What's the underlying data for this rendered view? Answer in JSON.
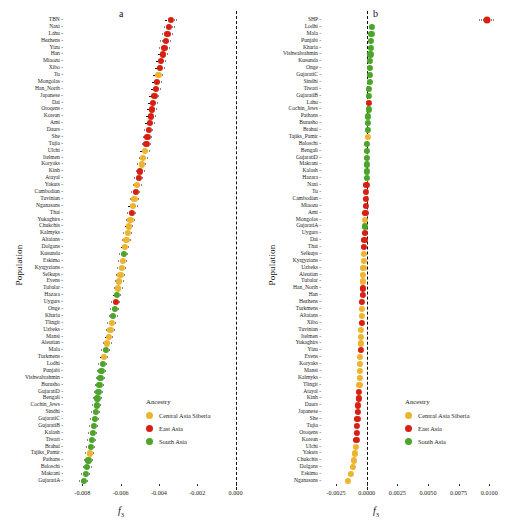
{
  "figure": {
    "ylabel": "Population",
    "panels": [
      "a",
      "b"
    ]
  },
  "legend": {
    "title": "Ancestry",
    "entries": [
      {
        "label": "Central Asia Siberia",
        "color": "#EDB430"
      },
      {
        "label": "East Asia",
        "color": "#D91F11"
      },
      {
        "label": "South Asia",
        "color": "#4CA52A"
      }
    ]
  },
  "chart_data": [
    {
      "type": "scatter",
      "panel": "a",
      "title": "a",
      "xlabel": "f3",
      "xlabel_sub": "3",
      "ylabel": "Population",
      "xlim": [
        -0.0088,
        0.0007
      ],
      "xticks": [
        -0.008,
        -0.006,
        -0.004,
        -0.002,
        0.0
      ],
      "xticklabels": [
        "-0.008",
        "-0.006",
        "-0.004",
        "-0.002",
        "0.000"
      ],
      "grid": false,
      "reference_line": 0.0,
      "legend_position": "lower-right",
      "categories": [
        "TBN",
        "Naxi",
        "Lahu",
        "Hezhens",
        "Yizu",
        "Han",
        "Miaozu",
        "Xibo",
        "Tu",
        "Mongolas",
        "Han_North",
        "Japanese",
        "Dai",
        "Oroqens",
        "Korean",
        "Ami",
        "Daurs",
        "She",
        "Tujia",
        "Ulchi",
        "Itelmen",
        "Koryaks",
        "Kinh",
        "Atayal",
        "Yakuts",
        "Cambodian",
        "Tuvinian",
        "Nganasans",
        "Thai",
        "Yukaghirs",
        "Chukchis",
        "Kalmyks",
        "Altaians",
        "Dolgans",
        "Kusunda",
        "Eskimo",
        "Kyrgyzians",
        "Selkups",
        "Evens",
        "Tubalar",
        "Hazara",
        "Uygurs",
        "Onge",
        "Kharia",
        "Tlingit",
        "Uzbeks",
        "Mansi",
        "Aleutian",
        "Mala",
        "Turkmens",
        "Lodhi",
        "Punjabi",
        "Vishwabrahmin",
        "Burusho",
        "GujaratiD",
        "Bengali",
        "Cochin_Jews",
        "Sindhi",
        "GujaratiC",
        "GujaratiB",
        "Kalash",
        "Tiwari",
        "Brahui",
        "Tajiks_Pamir",
        "Pathans",
        "Baloschi",
        "Makrani",
        "GujaratiA"
      ],
      "values": [
        -0.00338,
        -0.00346,
        -0.00356,
        -0.00364,
        -0.00372,
        -0.0038,
        -0.00388,
        -0.00396,
        -0.00403,
        -0.0041,
        -0.00417,
        -0.00424,
        -0.0043,
        -0.00436,
        -0.00442,
        -0.00448,
        -0.00454,
        -0.0046,
        -0.00466,
        -0.00474,
        -0.00482,
        -0.0049,
        -0.00498,
        -0.00506,
        -0.00514,
        -0.00521,
        -0.00528,
        -0.00535,
        -0.00542,
        -0.00549,
        -0.00556,
        -0.00563,
        -0.0057,
        -0.00577,
        -0.00583,
        -0.00589,
        -0.00595,
        -0.00601,
        -0.00607,
        -0.00613,
        -0.00619,
        -0.00625,
        -0.00632,
        -0.00639,
        -0.00646,
        -0.00653,
        -0.00661,
        -0.0067,
        -0.00679,
        -0.00687,
        -0.00694,
        -0.007,
        -0.00706,
        -0.00711,
        -0.00716,
        -0.00721,
        -0.00726,
        -0.00731,
        -0.00736,
        -0.00741,
        -0.00746,
        -0.00751,
        -0.00756,
        -0.00761,
        -0.00768,
        -0.00775,
        -0.00783,
        -0.00792
      ],
      "errors": [
        0.0003,
        0.00029,
        0.00029,
        0.00028,
        0.00028,
        0.00027,
        0.00027,
        0.00027,
        0.00026,
        0.00026,
        0.00026,
        0.00026,
        0.00025,
        0.00025,
        0.00025,
        0.00025,
        0.00025,
        0.00025,
        0.00025,
        0.00025,
        0.00024,
        0.00024,
        0.00024,
        0.00024,
        0.00024,
        0.00024,
        0.00024,
        0.00024,
        0.00024,
        0.00023,
        0.00023,
        0.00023,
        0.00023,
        0.00023,
        0.00023,
        0.00023,
        0.00023,
        0.00023,
        0.00023,
        0.00023,
        0.00023,
        0.00023,
        0.00023,
        0.00023,
        0.00023,
        0.00023,
        0.00023,
        0.00023,
        0.00023,
        0.00023,
        0.00023,
        0.00023,
        0.00023,
        0.00023,
        0.00023,
        0.00023,
        0.00023,
        0.00023,
        0.00023,
        0.00023,
        0.00023,
        0.00023,
        0.00023,
        0.00023,
        0.00023,
        0.00023,
        0.00023,
        0.00023
      ],
      "ancestry": [
        "East Asia",
        "East Asia",
        "East Asia",
        "East Asia",
        "East Asia",
        "East Asia",
        "East Asia",
        "East Asia",
        "Central Asia Siberia",
        "East Asia",
        "East Asia",
        "East Asia",
        "East Asia",
        "East Asia",
        "East Asia",
        "East Asia",
        "East Asia",
        "East Asia",
        "East Asia",
        "Central Asia Siberia",
        "Central Asia Siberia",
        "Central Asia Siberia",
        "East Asia",
        "East Asia",
        "Central Asia Siberia",
        "East Asia",
        "Central Asia Siberia",
        "Central Asia Siberia",
        "East Asia",
        "Central Asia Siberia",
        "Central Asia Siberia",
        "Central Asia Siberia",
        "Central Asia Siberia",
        "Central Asia Siberia",
        "South Asia",
        "Central Asia Siberia",
        "Central Asia Siberia",
        "Central Asia Siberia",
        "Central Asia Siberia",
        "Central Asia Siberia",
        "South Asia",
        "East Asia",
        "South Asia",
        "South Asia",
        "Central Asia Siberia",
        "Central Asia Siberia",
        "Central Asia Siberia",
        "Central Asia Siberia",
        "South Asia",
        "Central Asia Siberia",
        "South Asia",
        "South Asia",
        "South Asia",
        "South Asia",
        "South Asia",
        "South Asia",
        "South Asia",
        "South Asia",
        "South Asia",
        "South Asia",
        "South Asia",
        "South Asia",
        "South Asia",
        "Central Asia Siberia",
        "South Asia",
        "South Asia",
        "South Asia",
        "South Asia"
      ]
    },
    {
      "type": "scatter",
      "panel": "b",
      "title": "b",
      "xlabel": "f3",
      "xlabel_sub": "3",
      "ylabel": "Population",
      "xlim": [
        -0.0034,
        0.0112
      ],
      "xticks": [
        -0.0025,
        0.0,
        0.0025,
        0.005,
        0.0075,
        0.01
      ],
      "xticklabels": [
        "-0.0025",
        "0.0000",
        "0.0025",
        "0.0050",
        "0.0075",
        "0.0100"
      ],
      "grid": false,
      "reference_line": 0.0,
      "legend_position": "lower-right",
      "categories": [
        "SHP",
        "Lodhi",
        "Mala",
        "Punjabi",
        "Kharia",
        "Vishwabrahmin",
        "Kusunda",
        "Onge",
        "GujaratiC",
        "Sindhi",
        "Tiwari",
        "GujaratiB",
        "Lahu",
        "Cochin_Jews",
        "Pathans",
        "Burusho",
        "Brahui",
        "Tajiks_Pamir",
        "Baloschi",
        "Bengali",
        "GujaratiD",
        "Makrani",
        "Kalash",
        "Hazara",
        "Naxi",
        "Tu",
        "Cambodian",
        "Miaozu",
        "Ami",
        "Mongolas",
        "GujaratiA",
        "Uygurs",
        "Dai",
        "Thai",
        "Selkups",
        "Kyrgyzians",
        "Uzbeks",
        "Aleutian",
        "Tubalar",
        "Han_North",
        "Han",
        "Hezhens",
        "Turkmens",
        "Altaians",
        "Xibo",
        "Tuvinian",
        "Itelmen",
        "Yukaghirs",
        "Yizu",
        "Evens",
        "Koryaks",
        "Mansi",
        "Kalmyks",
        "Tlingit",
        "Atayal",
        "Kinh",
        "Daurs",
        "Japanese",
        "She",
        "Tujia",
        "Oroqens",
        "Korean",
        "Ulchi",
        "Yakuts",
        "Chukchis",
        "Dolgans",
        "Eskimo",
        "Nganasans"
      ],
      "values": [
        0.0098,
        0.00042,
        0.00038,
        0.00035,
        0.00033,
        0.00031,
        0.00029,
        0.00027,
        0.00025,
        0.00023,
        0.00021,
        0.00019,
        0.00017,
        0.00015,
        0.00013,
        0.00011,
        9e-05,
        7e-05,
        5e-05,
        4e-05,
        3e-05,
        2e-05,
        1e-05,
        0.0,
        -2e-05,
        -4e-05,
        -6e-05,
        -8e-05,
        -0.0001,
        -0.00012,
        -0.00014,
        -0.00016,
        -0.00018,
        -0.0002,
        -0.00022,
        -0.00024,
        -0.00026,
        -0.00028,
        -0.0003,
        -0.00032,
        -0.00034,
        -0.00036,
        -0.00038,
        -0.0004,
        -0.00042,
        -0.00044,
        -0.00046,
        -0.00048,
        -0.0005,
        -0.00052,
        -0.00054,
        -0.00056,
        -0.00058,
        -0.0006,
        -0.00063,
        -0.00066,
        -0.00069,
        -0.00072,
        -0.00075,
        -0.00078,
        -0.00081,
        -0.00084,
        -0.00088,
        -0.00094,
        -0.00102,
        -0.00112,
        -0.00126,
        -0.00152
      ],
      "errors": [
        0.0006,
        0.00011,
        0.00011,
        0.00011,
        0.00011,
        0.00011,
        0.00011,
        0.00011,
        0.00011,
        0.00011,
        0.00011,
        0.00011,
        0.00011,
        0.00011,
        0.00011,
        0.00011,
        0.00011,
        0.00011,
        0.00011,
        0.00011,
        0.00011,
        0.00011,
        0.00011,
        0.00011,
        0.00011,
        0.00011,
        0.00011,
        0.00011,
        0.00011,
        0.00011,
        0.00011,
        0.00011,
        0.00011,
        0.00011,
        0.00011,
        0.00011,
        0.00011,
        0.00011,
        0.00011,
        0.00011,
        0.00011,
        0.00011,
        0.00011,
        0.00011,
        0.00011,
        0.00011,
        0.00011,
        0.00011,
        0.00011,
        0.00011,
        0.00011,
        0.00011,
        0.00011,
        0.00011,
        0.00011,
        0.00011,
        0.00011,
        0.00011,
        0.00011,
        0.00011,
        0.00011,
        0.00011,
        0.00011,
        0.00011,
        0.00011,
        0.00011,
        0.00011,
        0.00011
      ],
      "ancestry": [
        "East Asia",
        "South Asia",
        "South Asia",
        "South Asia",
        "South Asia",
        "South Asia",
        "South Asia",
        "South Asia",
        "South Asia",
        "South Asia",
        "South Asia",
        "South Asia",
        "East Asia",
        "South Asia",
        "South Asia",
        "South Asia",
        "South Asia",
        "Central Asia Siberia",
        "South Asia",
        "South Asia",
        "South Asia",
        "South Asia",
        "South Asia",
        "South Asia",
        "East Asia",
        "East Asia",
        "East Asia",
        "East Asia",
        "East Asia",
        "Central Asia Siberia",
        "South Asia",
        "East Asia",
        "East Asia",
        "East Asia",
        "Central Asia Siberia",
        "Central Asia Siberia",
        "Central Asia Siberia",
        "Central Asia Siberia",
        "Central Asia Siberia",
        "East Asia",
        "East Asia",
        "East Asia",
        "Central Asia Siberia",
        "Central Asia Siberia",
        "East Asia",
        "Central Asia Siberia",
        "Central Asia Siberia",
        "Central Asia Siberia",
        "East Asia",
        "Central Asia Siberia",
        "Central Asia Siberia",
        "Central Asia Siberia",
        "Central Asia Siberia",
        "Central Asia Siberia",
        "East Asia",
        "East Asia",
        "East Asia",
        "East Asia",
        "East Asia",
        "East Asia",
        "East Asia",
        "East Asia",
        "Central Asia Siberia",
        "Central Asia Siberia",
        "Central Asia Siberia",
        "Central Asia Siberia",
        "Central Asia Siberia",
        "Central Asia Siberia"
      ]
    }
  ]
}
